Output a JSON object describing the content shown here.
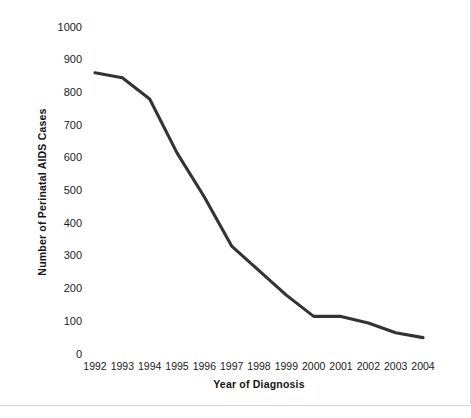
{
  "chart_data": {
    "type": "line",
    "title": "",
    "xlabel": "Year of Diagnosis",
    "ylabel": "Number of Perinatal AIDS Cases",
    "categories": [
      "1992",
      "1993",
      "1994",
      "1995",
      "1996",
      "1997",
      "1998",
      "1999",
      "2000",
      "2001",
      "2002",
      "2003",
      "2004"
    ],
    "values": [
      860,
      845,
      780,
      615,
      480,
      330,
      255,
      180,
      115,
      115,
      95,
      65,
      50
    ],
    "series": [
      {
        "name": "Perinatal AIDS Cases",
        "values": [
          860,
          845,
          780,
          615,
          480,
          330,
          255,
          180,
          115,
          115,
          95,
          65,
          50
        ]
      }
    ],
    "ylim": [
      0,
      1000
    ],
    "yticks": [
      "0",
      "100",
      "200",
      "300",
      "400",
      "500",
      "600",
      "700",
      "800",
      "900",
      "1000"
    ],
    "ytick_values": [
      0,
      100,
      200,
      300,
      400,
      500,
      600,
      700,
      800,
      900,
      1000
    ],
    "xticks": [
      "1992",
      "1993",
      "1994",
      "1995",
      "1996",
      "1997",
      "1998",
      "1999",
      "2000",
      "2001",
      "2002",
      "2003",
      "2004"
    ],
    "grid": false,
    "legend": false,
    "legend_position": "none",
    "line_color": "#333333",
    "background_color": "#ffffff",
    "markers": false
  }
}
